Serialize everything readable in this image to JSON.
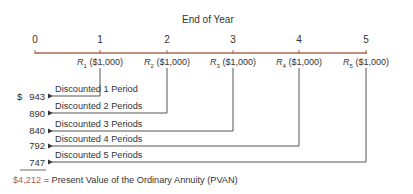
{
  "title": "End of Year",
  "timeline": {
    "ticks": [
      "0",
      "1",
      "2",
      "3",
      "4",
      "5"
    ],
    "line_color": "#a8674f"
  },
  "receipts": [
    {
      "symbol": "R",
      "sub": "1",
      "amount": "($1,000)"
    },
    {
      "symbol": "R",
      "sub": "2",
      "amount": "($1,000)"
    },
    {
      "symbol": "R",
      "sub": "3",
      "amount": "($1,000)"
    },
    {
      "symbol": "R",
      "sub": "4",
      "amount": "($1,000)"
    },
    {
      "symbol": "R",
      "sub": "5",
      "amount": "($1,000)"
    }
  ],
  "discounts": [
    {
      "label": "Discounted 1 Period",
      "value": "943",
      "prefix": "$"
    },
    {
      "label": "Discounted 2 Periods",
      "value": "890",
      "prefix": ""
    },
    {
      "label": "Discounted 3 Periods",
      "value": "840",
      "prefix": ""
    },
    {
      "label": "Discounted 4 Periods",
      "value": "792",
      "prefix": ""
    },
    {
      "label": "Discounted 5 Periods",
      "value": "747",
      "prefix": ""
    }
  ],
  "total": {
    "amount": "$4,212",
    "equals": "=",
    "label": "Present Value of the Ordinary Annuity (PVAN)",
    "amount_color": "#b5654a"
  }
}
